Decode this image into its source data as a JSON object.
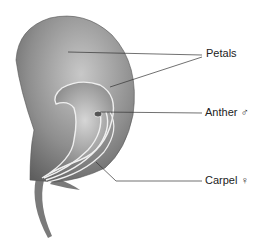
{
  "diagram": {
    "labels": [
      {
        "id": "petals",
        "text": "Petals",
        "x": 206,
        "y": 56
      },
      {
        "id": "anther",
        "text": "Anther ♂",
        "x": 205,
        "y": 109
      },
      {
        "id": "carpel",
        "text": "Carpel ♀",
        "x": 205,
        "y": 176
      }
    ],
    "colors": {
      "petal_dark": "#6f6f6f",
      "petal_light": "#c4c4c4",
      "outline": "#e8e8e8",
      "leader_line": "#333333",
      "text": "#222222"
    }
  }
}
